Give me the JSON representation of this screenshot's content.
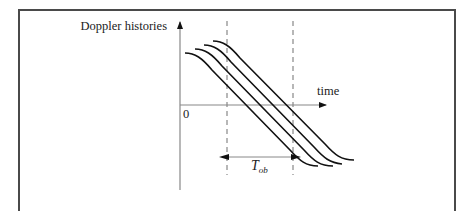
{
  "diagram": {
    "y_axis_label": "Doppler histories",
    "x_axis_label": "time",
    "origin_label": "0",
    "interval_label": {
      "main": "T",
      "subscript": "ob"
    },
    "curve_count": 4,
    "colors": {
      "frame": "#4a4a4a",
      "axis": "#888888",
      "curve": "#111111",
      "dashed": "#888888",
      "text": "#222222"
    }
  }
}
